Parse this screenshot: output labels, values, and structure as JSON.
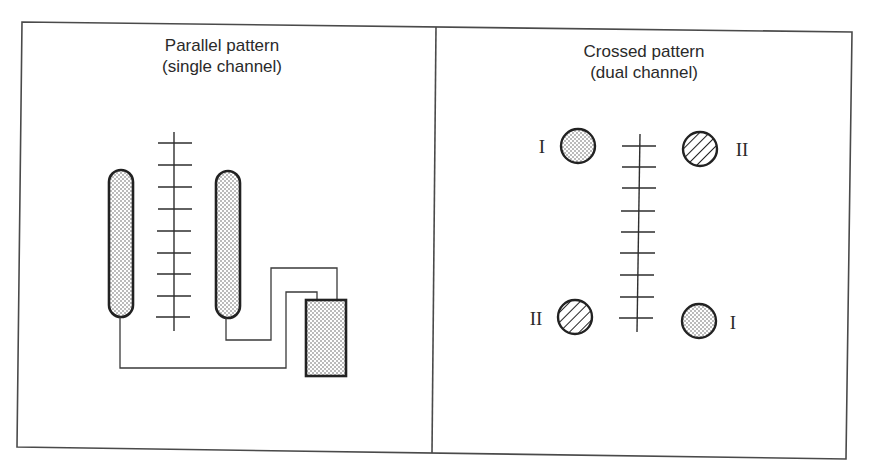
{
  "figure": {
    "panels": [
      {
        "id": "parallel",
        "title_line1": "Parallel pattern",
        "title_line2": "(single channel)",
        "electrode_arrangement": "two elongated electrodes flanking a central ladder, wired to a rectangular unit",
        "ladder_ticks": 9,
        "components": {
          "electrodes": [
            "left-elongated-electrode",
            "right-elongated-electrode"
          ],
          "unit": "rectangular-stippled-box"
        }
      },
      {
        "id": "crossed",
        "title_line1": "Crossed pattern",
        "title_line2": "(dual channel)",
        "ladder_ticks": 9,
        "electrodes": [
          {
            "position": "top-left",
            "channel_label": "I",
            "fill": "stippled"
          },
          {
            "position": "top-right",
            "channel_label": "II",
            "fill": "hatched"
          },
          {
            "position": "bottom-left",
            "channel_label": "II",
            "fill": "hatched"
          },
          {
            "position": "bottom-right",
            "channel_label": "I",
            "fill": "stippled"
          }
        ]
      }
    ],
    "colors": {
      "ink": "#222222",
      "frame": "#4a4a4a",
      "background": "#ffffff"
    }
  }
}
